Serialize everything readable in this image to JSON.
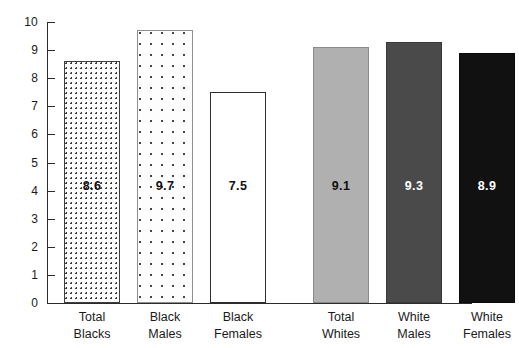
{
  "chart_data": {
    "type": "bar",
    "title": "",
    "subtitle": "",
    "xlabel": "",
    "ylabel": "",
    "ylim": [
      0,
      10
    ],
    "ytick_step": 1,
    "yticks": [
      "10",
      "9",
      "8",
      "7",
      "6",
      "5",
      "4",
      "3",
      "2",
      "1",
      "0"
    ],
    "grid": false,
    "legend": "none",
    "categories": [
      "Total Blacks",
      "Black Males",
      "Black Females",
      "Total Whites",
      "White Males",
      "White Females"
    ],
    "category_lines": [
      [
        "Total",
        "Blacks"
      ],
      [
        "Black",
        "Males"
      ],
      [
        "Black",
        "Females"
      ],
      [
        "Total",
        "Whites"
      ],
      [
        "White",
        "Males"
      ],
      [
        "White",
        "Females"
      ]
    ],
    "values": [
      8.6,
      9.7,
      7.5,
      9.1,
      9.3,
      8.9
    ],
    "value_labels": [
      "8.6",
      "9.7",
      "7.5",
      "9.1",
      "9.3",
      "8.9"
    ],
    "bar_fills": [
      "dots-dense",
      "dots-sparse",
      "white-outline",
      "gray-light",
      "gray-dark",
      "black"
    ],
    "bar_colors": [
      "#fdfdfd",
      "#fdfdfd",
      "#ffffff",
      "#b0b0b0",
      "#4a4a4a",
      "#111111"
    ],
    "group_gap_after_index": 2,
    "axis_color": "#2b2b2b"
  }
}
